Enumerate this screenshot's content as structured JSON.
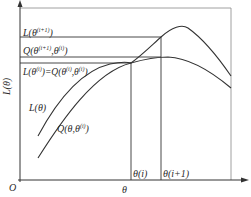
{
  "diagram": {
    "type": "EM algorithm illustration",
    "y_axis_label": "L(θ)",
    "x_axis_label": "θ",
    "origin_label": "O",
    "horizontal_levels": [
      {
        "label": "L(θ^(i+1))",
        "text": "L(θ",
        "sup": "(i+1)",
        "tail": ")"
      },
      {
        "label": "Q(θ^(i+1),θ^(i))",
        "text": "Q(θ",
        "sup": "(i+1)",
        "mid": ",θ",
        "sup2": "(i)",
        "tail": ")"
      },
      {
        "label": "L(θ^(i))=Q(θ^(i),θ^(i))",
        "text": "L(θ",
        "sup": "(i)",
        "mid": ")=Q(θ",
        "sup2": "(i)",
        "mid2": ",θ",
        "sup3": "(i)",
        "tail": ")"
      }
    ],
    "curves": [
      {
        "name": "L(θ)",
        "label": "L(θ)"
      },
      {
        "name": "Q(θ,θ^(i))",
        "label_main": "Q(θ,θ",
        "label_sup": "(i)",
        "label_tail": ")"
      }
    ],
    "vertical_markers": [
      {
        "label": "θ(i)"
      },
      {
        "label": "θ(i+1)"
      }
    ]
  }
}
